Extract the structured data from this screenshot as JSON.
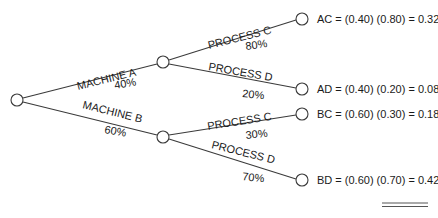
{
  "diagram": {
    "type": "probability-tree",
    "root": {
      "label": ""
    },
    "level1": [
      {
        "name": "MACHINE A",
        "prob": "40%"
      },
      {
        "name": "MACHINE B",
        "prob": "60%"
      }
    ],
    "level2": [
      {
        "parent": "MACHINE A",
        "name": "PROCESS C",
        "prob": "80%"
      },
      {
        "parent": "MACHINE A",
        "name": "PROCESS D",
        "prob": "20%"
      },
      {
        "parent": "MACHINE B",
        "name": "PROCESS C",
        "prob": "30%"
      },
      {
        "parent": "MACHINE B",
        "name": "PROCESS D",
        "prob": "70%"
      }
    ],
    "outcomes": [
      {
        "text": "AC = (0.40) (0.80) = 0.32"
      },
      {
        "text": "AD = (0.40) (0.20) = 0.08"
      },
      {
        "text": "BC = (0.60) (0.30) = 0.18"
      },
      {
        "text": "BD = (0.60) (0.70) = 0.42"
      }
    ]
  }
}
